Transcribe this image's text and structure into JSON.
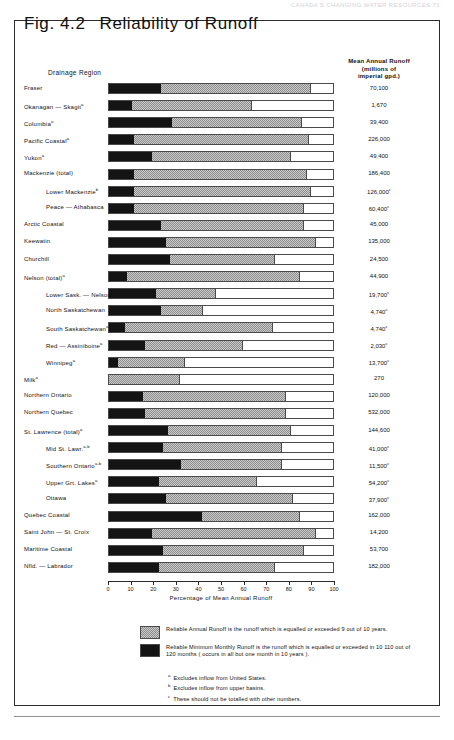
{
  "scan_header": "CANADA'S CHANGING WATER RESOURCES  71",
  "figure": {
    "number": "Fig. 4.2",
    "title": "Reliability of Runoff",
    "region_column_header": "Drainage Region",
    "runoff_column_header_lines": [
      "Mean Annual Runoff",
      "(millions of",
      "imperial gpd.)"
    ]
  },
  "legend": {
    "items": [
      {
        "swatch": "hatch",
        "text": "Reliable Annual Runoff is the runoff which is equalled or exceeded 9 out of 10 years."
      },
      {
        "swatch": "dark",
        "text": "Reliable Minimum Monthly Runoff is the runoff which is equalled or exceeded in 10 110 out of 120 months ( occurs in all but one month in 10 years )."
      }
    ]
  },
  "notes": [
    {
      "marker": "a",
      "text": "Excludes inflow from United States."
    },
    {
      "marker": "b",
      "text": "Excludes inflow from upper basins."
    },
    {
      "marker": "c",
      "text": "These should not be totalled with other numbers."
    }
  ],
  "chart_data": {
    "type": "bar",
    "title": "Reliability of Runoff",
    "xlabel": "Percentage of Mean Annual Runoff",
    "ylabel": "Drainage Region",
    "xlim": [
      0,
      100
    ],
    "xticks": [
      0,
      10,
      20,
      30,
      40,
      50,
      60,
      70,
      80,
      90,
      100
    ],
    "grid": false,
    "legend_position": "bottom",
    "series": [
      {
        "name": "Reliable Minimum Monthly Runoff",
        "fill": "dark"
      },
      {
        "name": "Reliable Annual Runoff",
        "fill": "hatch"
      }
    ],
    "categories": [
      "Fraser",
      "Okanagan — Skagit",
      "Columbia",
      "Pacific Coastal",
      "Yukon",
      "Mackenzie (total)",
      "Lower Mackenzie",
      "Peace — Athabasca",
      "Arctic Coastal",
      "Keewatin",
      "Churchill",
      "Nelson (total)",
      "Lower Sask. — Nelson",
      "North Saskatchewan",
      "South Saskatchewan",
      "Red — Assiniboine",
      "Winnipeg",
      "Milk",
      "Northern Ontario",
      "Northern Quebec",
      "St. Lawrence (total)",
      "Mid St. Lawr.",
      "Southern Ontario",
      "Upper Grt. Lakes",
      "Ottawa",
      "Quebec Coastal",
      "Saint John — St. Croix",
      "Maritime Coastal",
      "Nfld. — Labrador"
    ],
    "rows": [
      {
        "label": "Fraser",
        "sup": "",
        "indent": 0,
        "min_monthly": 23,
        "annual": 89,
        "runoff": "70,100",
        "runoff_sup": ""
      },
      {
        "label": "Okanagan — Skagit",
        "sup": "a",
        "indent": 0,
        "min_monthly": 10,
        "annual": 63,
        "runoff": "1,670",
        "runoff_sup": ""
      },
      {
        "label": "Columbia",
        "sup": "a",
        "indent": 0,
        "min_monthly": 28,
        "annual": 85,
        "runoff": "39,400",
        "runoff_sup": ""
      },
      {
        "label": "Pacific Coastal",
        "sup": "a",
        "indent": 0,
        "min_monthly": 11,
        "annual": 88,
        "runoff": "226,000",
        "runoff_sup": ""
      },
      {
        "label": "Yukon",
        "sup": "a",
        "indent": 0,
        "min_monthly": 19,
        "annual": 80,
        "runoff": "49,400",
        "runoff_sup": ""
      },
      {
        "label": "Mackenzie (total)",
        "sup": "",
        "indent": 0,
        "min_monthly": 11,
        "annual": 87,
        "runoff": "186,400",
        "runoff_sup": ""
      },
      {
        "label": "Lower Mackenzie",
        "sup": "b",
        "indent": 1,
        "min_monthly": 11,
        "annual": 89,
        "runoff": "126,000",
        "runoff_sup": "c"
      },
      {
        "label": "Peace — Athabasca",
        "sup": "",
        "indent": 1,
        "min_monthly": 11,
        "annual": 86,
        "runoff": "60,400",
        "runoff_sup": "c"
      },
      {
        "label": "Arctic Coastal",
        "sup": "",
        "indent": 0,
        "min_monthly": 23,
        "annual": 86,
        "runoff": "45,000",
        "runoff_sup": ""
      },
      {
        "label": "Keewatin",
        "sup": "",
        "indent": 0,
        "min_monthly": 25,
        "annual": 91,
        "runoff": "135,000",
        "runoff_sup": ""
      },
      {
        "label": "Churchill",
        "sup": "",
        "indent": 0,
        "min_monthly": 27,
        "annual": 73,
        "runoff": "24,500",
        "runoff_sup": ""
      },
      {
        "label": "Nelson (total)",
        "sup": "a",
        "indent": 0,
        "min_monthly": 8,
        "annual": 84,
        "runoff": "44,900",
        "runoff_sup": ""
      },
      {
        "label": "Lower Sask. — Nelson",
        "sup": "a",
        "indent": 1,
        "min_monthly": 21,
        "annual": 47,
        "runoff": "19,700",
        "runoff_sup": "c"
      },
      {
        "label": "North Saskatchewan",
        "sup": "",
        "indent": 1,
        "min_monthly": 23,
        "annual": 41,
        "runoff": "4,740",
        "runoff_sup": "c"
      },
      {
        "label": "South Saskatchewan",
        "sup": "a",
        "indent": 1,
        "min_monthly": 7,
        "annual": 72,
        "runoff": "4,740",
        "runoff_sup": "c"
      },
      {
        "label": "Red — Assiniboine",
        "sup": "a",
        "indent": 1,
        "min_monthly": 16,
        "annual": 59,
        "runoff": "2,030",
        "runoff_sup": "c"
      },
      {
        "label": "Winnipeg",
        "sup": "a",
        "indent": 1,
        "min_monthly": 4,
        "annual": 33,
        "runoff": "13,700",
        "runoff_sup": "c"
      },
      {
        "label": "Milk",
        "sup": "a",
        "indent": 0,
        "min_monthly": 0,
        "annual": 31,
        "runoff": "270",
        "runoff_sup": ""
      },
      {
        "label": "Northern Ontario",
        "sup": "",
        "indent": 0,
        "min_monthly": 15,
        "annual": 78,
        "runoff": "120,000",
        "runoff_sup": ""
      },
      {
        "label": "Northern Quebec",
        "sup": "",
        "indent": 0,
        "min_monthly": 16,
        "annual": 78,
        "runoff": "532,000",
        "runoff_sup": ""
      },
      {
        "label": "St. Lawrence (total)",
        "sup": "a",
        "indent": 0,
        "min_monthly": 26,
        "annual": 80,
        "runoff": "144,600",
        "runoff_sup": ""
      },
      {
        "label": "Mid St. Lawr.",
        "sup": "a,b",
        "indent": 1,
        "min_monthly": 24,
        "annual": 76,
        "runoff": "41,000",
        "runoff_sup": "c"
      },
      {
        "label": "Southern Ontario",
        "sup": "a,b",
        "indent": 1,
        "min_monthly": 32,
        "annual": 76,
        "runoff": "11,500",
        "runoff_sup": "c"
      },
      {
        "label": "Upper Grt. Lakes",
        "sup": "a",
        "indent": 1,
        "min_monthly": 22,
        "annual": 65,
        "runoff": "54,200",
        "runoff_sup": "c"
      },
      {
        "label": "Ottawa",
        "sup": "",
        "indent": 1,
        "min_monthly": 25,
        "annual": 81,
        "runoff": "37,900",
        "runoff_sup": "c"
      },
      {
        "label": "Quebec Coastal",
        "sup": "",
        "indent": 0,
        "min_monthly": 41,
        "annual": 84,
        "runoff": "162,000",
        "runoff_sup": ""
      },
      {
        "label": "Saint John — St. Croix",
        "sup": "",
        "indent": 0,
        "min_monthly": 19,
        "annual": 91,
        "runoff": "14,200",
        "runoff_sup": ""
      },
      {
        "label": "Maritime Coastal",
        "sup": "",
        "indent": 0,
        "min_monthly": 24,
        "annual": 86,
        "runoff": "53,700",
        "runoff_sup": ""
      },
      {
        "label": "Nfld. — Labrador",
        "sup": "",
        "indent": 0,
        "min_monthly": 22,
        "annual": 73,
        "runoff": "182,000",
        "runoff_sup": ""
      }
    ]
  }
}
